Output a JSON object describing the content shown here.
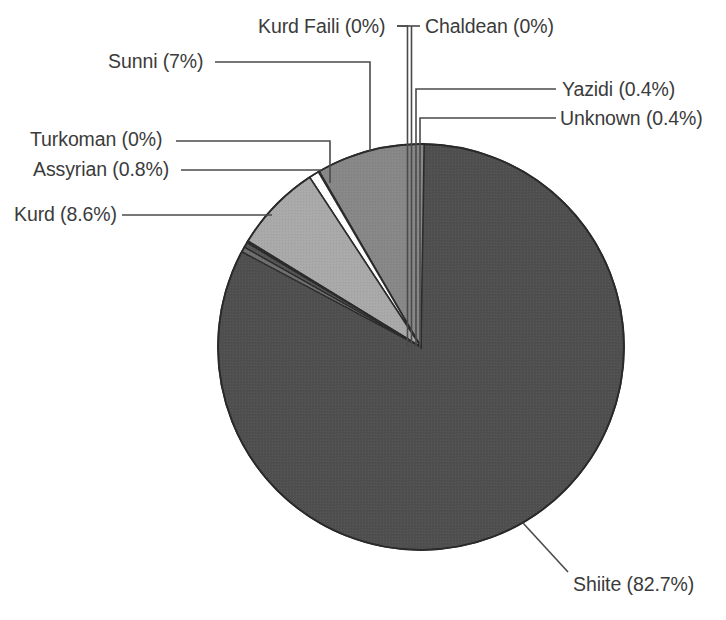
{
  "chart_data": {
    "type": "pie",
    "title": "",
    "subtitle": "",
    "xlabel": "",
    "ylabel": "",
    "legend_position": "none",
    "grid": false,
    "label_format": "name (percent%)",
    "start_angle_deg": 0,
    "direction": "clockwise",
    "categories": [
      "Shiite",
      "Yazidi",
      "Unknown",
      "Chaldean",
      "Kurd Faili",
      "Sunni",
      "Assyrian",
      "Turkoman",
      "Kurd"
    ],
    "values": [
      82.7,
      0.4,
      0.4,
      0.0,
      0.0,
      7.0,
      0.8,
      0.0,
      8.6
    ],
    "slices": [
      {
        "name": "Shiite",
        "percent": 82.7,
        "label": "Shiite (82.7%)",
        "color": "#4f4f4f"
      },
      {
        "name": "Yazidi",
        "percent": 0.4,
        "label": "Yazidi (0.4%)",
        "color": "#6e6e6e"
      },
      {
        "name": "Unknown",
        "percent": 0.4,
        "label": "Unknown (0.4%)",
        "color": "#545454"
      },
      {
        "name": "Chaldean",
        "percent": 0.0,
        "label": "Chaldean (0%)",
        "color": "#9a9a9a"
      },
      {
        "name": "Kurd Faili",
        "percent": 0.0,
        "label": "Kurd Faili (0%)",
        "color": "#8a8a8a"
      },
      {
        "name": "Sunni",
        "percent": 7.0,
        "label": "Sunni (7%)",
        "color": "#a9a9a9"
      },
      {
        "name": "Assyrian",
        "percent": 0.8,
        "label": "Assyrian (0.8%)",
        "color": "#ffffff"
      },
      {
        "name": "Turkoman",
        "percent": 0.0,
        "label": "Turkoman (0%)",
        "color": "#c4c4c4"
      },
      {
        "name": "Kurd",
        "percent": 8.6,
        "label": "Kurd (8.6%)",
        "color": "#878787"
      }
    ]
  },
  "labels": {
    "kurd_faili": "Kurd Faili (0%)",
    "chaldean": "Chaldean (0%)",
    "sunni": "Sunni (7%)",
    "yazidi": "Yazidi (0.4%)",
    "unknown": "Unknown (0.4%)",
    "turkoman": "Turkoman (0%)",
    "assyrian": "Assyrian (0.8%)",
    "kurd": "Kurd (8.6%)",
    "shiite": "Shiite (82.7%)"
  },
  "colors": {
    "shiite": "#4f4f4f",
    "kurd": "#878787",
    "sunni": "#a9a9a9",
    "assyrian": "#ffffff",
    "outline": "#2a2a2a",
    "leader_line": "#4a4a4a",
    "text": "#3b3b3b",
    "background": "#ffffff"
  }
}
